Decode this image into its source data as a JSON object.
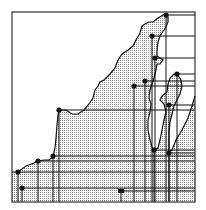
{
  "figure": {
    "type": "map-diagram",
    "frame": {
      "x": 12,
      "y": 12,
      "w": 183,
      "h": 190
    },
    "colors": {
      "background": "#ffffff",
      "land_stipple": "#9a9a9a",
      "line": "#111111",
      "frame": "#333333"
    },
    "coastline": [
      [
        12,
        172
      ],
      [
        18,
        172
      ],
      [
        26,
        166
      ],
      [
        34,
        163
      ],
      [
        38,
        161
      ],
      [
        44,
        160
      ],
      [
        49,
        160
      ],
      [
        53,
        157
      ],
      [
        55,
        148
      ],
      [
        56,
        138
      ],
      [
        57,
        125
      ],
      [
        58,
        115
      ],
      [
        59,
        110
      ],
      [
        66,
        110
      ],
      [
        72,
        114
      ],
      [
        78,
        114
      ],
      [
        84,
        110
      ],
      [
        89,
        104
      ],
      [
        93,
        98
      ],
      [
        95,
        90
      ],
      [
        98,
        86
      ],
      [
        100,
        82
      ],
      [
        104,
        80
      ],
      [
        110,
        74
      ],
      [
        115,
        68
      ],
      [
        118,
        60
      ],
      [
        122,
        54
      ],
      [
        128,
        50
      ],
      [
        133,
        46
      ],
      [
        136,
        40
      ],
      [
        140,
        33
      ],
      [
        142,
        26
      ],
      [
        145,
        24
      ],
      [
        149,
        22
      ],
      [
        153,
        22
      ],
      [
        158,
        18
      ],
      [
        163,
        15
      ],
      [
        166,
        14
      ],
      [
        168,
        17
      ],
      [
        168,
        22
      ],
      [
        166,
        27
      ],
      [
        162,
        33
      ],
      [
        160,
        36
      ],
      [
        158,
        42
      ],
      [
        157,
        50
      ],
      [
        157,
        56
      ],
      [
        160,
        58
      ],
      [
        163,
        60
      ],
      [
        160,
        64
      ],
      [
        157,
        64
      ],
      [
        156,
        70
      ],
      [
        154,
        78
      ],
      [
        152,
        84
      ],
      [
        150,
        90
      ],
      [
        149,
        98
      ],
      [
        151,
        104
      ],
      [
        150,
        112
      ],
      [
        148,
        120
      ],
      [
        148,
        130
      ],
      [
        150,
        140
      ],
      [
        152,
        147
      ],
      [
        154,
        150
      ],
      [
        158,
        148
      ],
      [
        160,
        140
      ],
      [
        162,
        130
      ],
      [
        164,
        120
      ],
      [
        166,
        112
      ],
      [
        164,
        104
      ],
      [
        160,
        100
      ],
      [
        162,
        96
      ],
      [
        167,
        92
      ],
      [
        168,
        84
      ],
      [
        170,
        78
      ],
      [
        174,
        74
      ],
      [
        177,
        74
      ],
      [
        181,
        80
      ],
      [
        182,
        86
      ],
      [
        180,
        94
      ],
      [
        177,
        100
      ],
      [
        174,
        106
      ],
      [
        172,
        114
      ],
      [
        170,
        122
      ],
      [
        169,
        132
      ],
      [
        169,
        142
      ],
      [
        169,
        152
      ],
      [
        172,
        150
      ],
      [
        176,
        140
      ],
      [
        182,
        130
      ],
      [
        188,
        118
      ],
      [
        192,
        106
      ],
      [
        195,
        96
      ],
      [
        195,
        202
      ],
      [
        12,
        202
      ]
    ],
    "stations": [
      {
        "id": 1,
        "x": 166,
        "y": 15,
        "shape": "dot"
      },
      {
        "id": 2,
        "x": 152,
        "y": 36,
        "shape": "dot"
      },
      {
        "id": 3,
        "x": 155,
        "y": 58,
        "shape": "dot"
      },
      {
        "id": 4,
        "x": 145,
        "y": 81,
        "shape": "dot"
      },
      {
        "id": 5,
        "x": 134,
        "y": 86,
        "shape": "dot"
      },
      {
        "id": 6,
        "x": 177,
        "y": 74,
        "shape": "dot"
      },
      {
        "id": 7,
        "x": 169,
        "y": 105,
        "shape": "dot"
      },
      {
        "id": 8,
        "x": 59,
        "y": 110,
        "shape": "dot"
      },
      {
        "id": 9,
        "x": 53,
        "y": 156,
        "shape": "dot"
      },
      {
        "id": 10,
        "x": 38,
        "y": 161,
        "shape": "dot"
      },
      {
        "id": 11,
        "x": 18,
        "y": 172,
        "shape": "dot"
      },
      {
        "id": 12,
        "x": 22,
        "y": 188,
        "shape": "dot"
      },
      {
        "id": 13,
        "x": 121,
        "y": 191,
        "shape": "square"
      },
      {
        "id": 14,
        "x": 154,
        "y": 150,
        "shape": "dot"
      },
      {
        "id": 15,
        "x": 169,
        "y": 153,
        "shape": "dot"
      }
    ]
  }
}
